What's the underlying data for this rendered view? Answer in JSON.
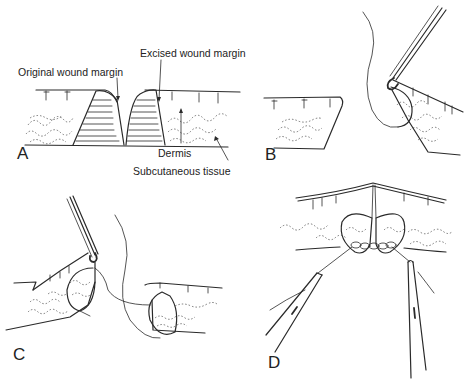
{
  "figure": {
    "panels": [
      {
        "letter": "A",
        "caption_labels": [
          "Original wound margin",
          "Excised wound margin",
          "Dermis",
          "Subcutaneous tissue"
        ]
      },
      {
        "letter": "B"
      },
      {
        "letter": "C"
      },
      {
        "letter": "D"
      }
    ],
    "labels": {
      "original_wound_margin": "Original wound margin",
      "excised_wound_margin": "Excised wound margin",
      "dermis": "Dermis",
      "subcutaneous_tissue": "Subcutaneous tissue"
    },
    "colors": {
      "ink": "#2a2a2a",
      "background": "#ffffff"
    }
  }
}
